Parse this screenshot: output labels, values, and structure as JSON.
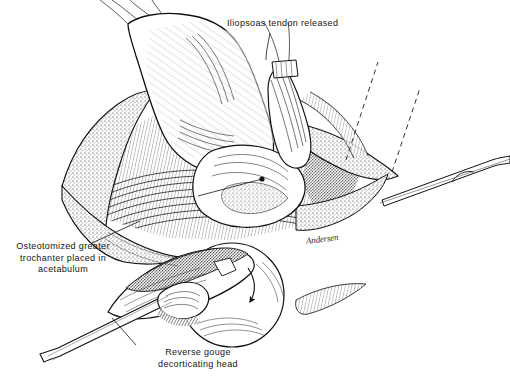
{
  "figure": {
    "background_color": "#ffffff",
    "ink_color": "#141414",
    "width": 510,
    "height": 380
  },
  "labels": {
    "iliopsoas": "Iliopsoas tendon released",
    "trochanter": "Osteotomized greater trochanter placed in acetabulum",
    "gouge_line1": "Reverse gouge",
    "gouge_line2": "decorticating head"
  },
  "signature": {
    "text": "Andersen"
  },
  "annotations": {
    "leader_iliopsoas": "leader line from iliopsoas label down to tendon stump",
    "leader_trochanter": "leader line from trochanter label up-right to graft",
    "leader_gouge": "leader line from gouge caption up-right to instrument handle",
    "rotation_arrow": "curved arrow indicating gouge rotation on femoral head",
    "dashed_lines": "two dashed reference lines at upper right",
    "pointer_dot": "dot marker on acetabular floor"
  },
  "structures": [
    "ilium",
    "acetabulum",
    "femoral head",
    "iliopsoas tendon",
    "gluteal muscle",
    "subcutaneous fat margin",
    "retractor rod",
    "reverse gouge instrument"
  ]
}
